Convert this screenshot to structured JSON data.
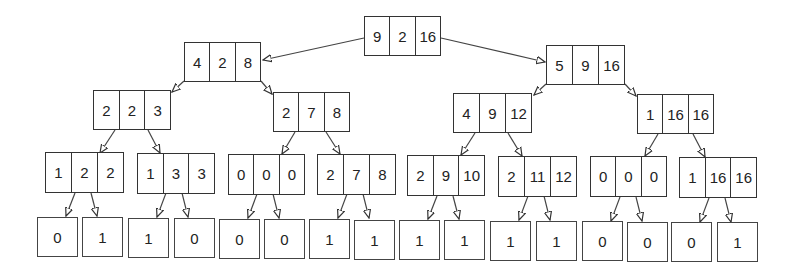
{
  "tree": {
    "root": {
      "values": [
        "9",
        "2",
        "16"
      ]
    },
    "level1": [
      {
        "values": [
          "4",
          "2",
          "8"
        ]
      },
      {
        "values": [
          "5",
          "9",
          "16"
        ]
      }
    ],
    "level2": [
      {
        "values": [
          "2",
          "2",
          "3"
        ]
      },
      {
        "values": [
          "2",
          "7",
          "8"
        ]
      },
      {
        "values": [
          "4",
          "9",
          "12"
        ]
      },
      {
        "values": [
          "1",
          "16",
          "16"
        ]
      }
    ],
    "level3": [
      {
        "values": [
          "1",
          "2",
          "2"
        ]
      },
      {
        "values": [
          "1",
          "3",
          "3"
        ]
      },
      {
        "values": [
          "0",
          "0",
          "0"
        ]
      },
      {
        "values": [
          "2",
          "7",
          "8"
        ]
      },
      {
        "values": [
          "2",
          "9",
          "10"
        ]
      },
      {
        "values": [
          "2",
          "11",
          "12"
        ]
      },
      {
        "values": [
          "0",
          "0",
          "0"
        ]
      },
      {
        "values": [
          "1",
          "16",
          "16"
        ]
      }
    ],
    "leaves": [
      "0",
      "1",
      "1",
      "0",
      "0",
      "0",
      "1",
      "1",
      "1",
      "1",
      "1",
      "1",
      "0",
      "0",
      "0",
      "1"
    ]
  },
  "colors": {
    "line": "#333333",
    "background": "#ffffff"
  }
}
